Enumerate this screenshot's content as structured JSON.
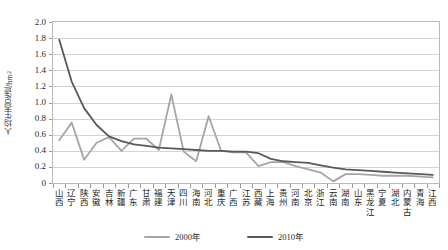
{
  "chart_data": {
    "type": "line",
    "title": "",
    "xlabel": "",
    "ylabel": "人均生态足迹/hm",
    "ylabel_sup": "2",
    "ylim": [
      0,
      2.0
    ],
    "ytick_step": 0.2,
    "yticks": [
      "2.0",
      "1.8",
      "1.6",
      "1.4",
      "1.2",
      "1.0",
      "0.8",
      "0.6",
      "0.4",
      "0.2",
      "0"
    ],
    "grid": true,
    "legend_position": "bottom-center",
    "categories": [
      "山西",
      "辽宁",
      "陕西",
      "安徽",
      "吉林",
      "新疆",
      "广东",
      "甘肃",
      "福建",
      "天津",
      "四川",
      "海南",
      "河北",
      "重庆",
      "广西",
      "江苏",
      "西藏",
      "上海",
      "贵州",
      "河南",
      "北京",
      "浙江",
      "云南",
      "湖南",
      "山东",
      "黑龙江",
      "宁夏",
      "湖北",
      "内蒙古",
      "青海",
      "江西"
    ],
    "series": [
      {
        "name": "2000年",
        "color": "#a6a6a6",
        "values": [
          0.53,
          0.75,
          0.29,
          0.5,
          0.57,
          0.4,
          0.55,
          0.55,
          0.41,
          1.1,
          0.39,
          0.27,
          0.83,
          0.4,
          0.38,
          0.38,
          0.21,
          0.26,
          0.26,
          0.21,
          0.17,
          0.13,
          0.02,
          0.11,
          0.11,
          0.1,
          0.09,
          0.09,
          0.09,
          0.08,
          0.07
        ]
      },
      {
        "name": "2010年",
        "color": "#595959",
        "values": [
          1.78,
          1.26,
          0.93,
          0.72,
          0.58,
          0.52,
          0.48,
          0.46,
          0.44,
          0.43,
          0.42,
          0.41,
          0.4,
          0.4,
          0.39,
          0.39,
          0.37,
          0.3,
          0.27,
          0.26,
          0.25,
          0.22,
          0.19,
          0.17,
          0.16,
          0.15,
          0.14,
          0.13,
          0.12,
          0.11,
          0.1
        ]
      }
    ]
  },
  "legend": {
    "items": [
      {
        "label": "2000年",
        "color": "#a6a6a6"
      },
      {
        "label": "2010年",
        "color": "#595959"
      }
    ]
  }
}
